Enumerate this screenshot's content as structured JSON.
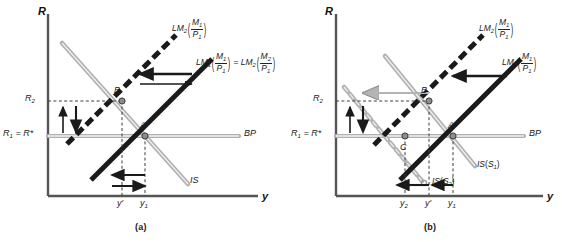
{
  "figure": {
    "type": "economics-diagram"
  },
  "panels": [
    {
      "id": "a",
      "caption": "(a)",
      "axes": {
        "y_axis_label": "R",
        "x_axis_label": "y"
      },
      "y_ticks": [
        {
          "id": "R2",
          "label_main": "R",
          "label_sub": "2",
          "label_tail": ""
        },
        {
          "id": "R1",
          "label_main": "R",
          "label_sub": "1",
          "label_tail": " = R*"
        }
      ],
      "x_ticks": [
        {
          "id": "yprime",
          "label_main": "y",
          "label_sub": "",
          "label_tail": "′"
        },
        {
          "id": "y1",
          "label_main": "y",
          "label_sub": "1",
          "label_tail": ""
        }
      ],
      "curves": [
        {
          "id": "LM2",
          "name": "LM",
          "name_sub": "2",
          "num": "M",
          "num_sub": "1",
          "den": "P",
          "den_sub": "1",
          "style": "dashed-black"
        },
        {
          "id": "LM1",
          "name": "LM",
          "name_sub": "1",
          "num": "M",
          "num_sub": "1",
          "den": "P",
          "den_sub": "1",
          "style": "solid-black",
          "equals": true,
          "eq_name": "LM",
          "eq_name_sub": "2",
          "eq_num": "M",
          "eq_num_sub": "2",
          "eq_den": "P",
          "eq_den_sub": "1"
        },
        {
          "id": "IS",
          "name": "IS",
          "name_sub": "",
          "style": "gray"
        },
        {
          "id": "BP",
          "name": "BP",
          "name_sub": "",
          "style": "gray-horizontal"
        }
      ],
      "points": [
        {
          "id": "A",
          "label": "A"
        },
        {
          "id": "B",
          "label": "B"
        }
      ]
    },
    {
      "id": "b",
      "caption": "(b)",
      "axes": {
        "y_axis_label": "R",
        "x_axis_label": "y"
      },
      "y_ticks": [
        {
          "id": "R2",
          "label_main": "R",
          "label_sub": "2",
          "label_tail": ""
        },
        {
          "id": "R1",
          "label_main": "R",
          "label_sub": "1",
          "label_tail": " = R*"
        }
      ],
      "x_ticks": [
        {
          "id": "y2",
          "label_main": "y",
          "label_sub": "2",
          "label_tail": ""
        },
        {
          "id": "yprime",
          "label_main": "y",
          "label_sub": "",
          "label_tail": "′"
        },
        {
          "id": "y1",
          "label_main": "y",
          "label_sub": "1",
          "label_tail": ""
        }
      ],
      "curves": [
        {
          "id": "LM2",
          "name": "LM",
          "name_sub": "2",
          "num": "M",
          "num_sub": "1",
          "den": "P",
          "den_sub": "1",
          "style": "dashed-black"
        },
        {
          "id": "LM1",
          "name": "LM",
          "name_sub": "1",
          "num": "M",
          "num_sub": "1",
          "den": "P",
          "den_sub": "1",
          "style": "solid-black"
        },
        {
          "id": "IS_S1",
          "name": "IS",
          "arg": "S",
          "arg_sub": "1",
          "style": "gray"
        },
        {
          "id": "IS_S2",
          "name": "IS",
          "arg": "S",
          "arg_sub": "2",
          "style": "gray-chain"
        },
        {
          "id": "BP",
          "name": "BP",
          "name_sub": "",
          "style": "gray-horizontal"
        }
      ],
      "points": [
        {
          "id": "A",
          "label": "A"
        },
        {
          "id": "B",
          "label": "B"
        },
        {
          "id": "C",
          "label": "C"
        }
      ]
    }
  ],
  "colors": {
    "curve_black": "#1a1a1a",
    "curve_gray": "#a8a8a8",
    "axis": "#555555",
    "dashed_guide": "#444444",
    "text": "#1a1a1a"
  }
}
